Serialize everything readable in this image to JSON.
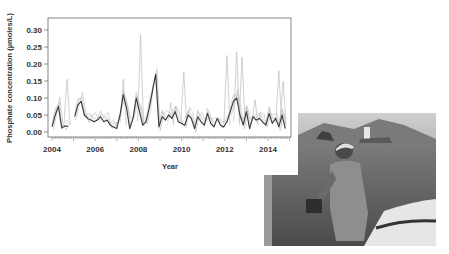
{
  "chart_data": {
    "type": "line",
    "title": "",
    "xlabel": "Year",
    "ylabel": "Phosphate concentration (µmoles/L)",
    "xlim": [
      2003.8,
      2015.0
    ],
    "ylim": [
      -0.01,
      0.33
    ],
    "x_ticks": [
      "2004",
      "2006",
      "2008",
      "2010",
      "2012",
      "2014"
    ],
    "y_ticks": [
      "0.00",
      "0.05",
      "0.10",
      "0.15",
      "0.20",
      "0.25",
      "0.30"
    ],
    "grid": false,
    "legend": null,
    "series": [
      {
        "name": "mean (dark line)",
        "color": "#3a3a3a",
        "segments": [
          {
            "x": [
              2004.0,
              2004.15,
              2004.3,
              2004.45,
              2004.6,
              2004.75
            ],
            "y": [
              0.015,
              0.05,
              0.075,
              0.012,
              0.018,
              0.016
            ]
          },
          {
            "x": [
              2005.05,
              2005.2,
              2005.35,
              2005.5,
              2005.65,
              2005.8,
              2005.95,
              2006.1,
              2006.25,
              2006.4,
              2006.55,
              2006.7,
              2006.85,
              2007.0,
              2007.15,
              2007.3,
              2007.45,
              2007.6,
              2007.75,
              2007.9,
              2008.05,
              2008.2,
              2008.35,
              2008.5,
              2008.65,
              2008.8,
              2008.95,
              2009.1,
              2009.25,
              2009.4,
              2009.55,
              2009.7,
              2009.85,
              2010.0,
              2010.15,
              2010.3,
              2010.45,
              2010.6,
              2010.75,
              2010.9,
              2011.05,
              2011.2,
              2011.35,
              2011.5,
              2011.65,
              2011.8,
              2011.95,
              2012.1,
              2012.25,
              2012.4,
              2012.55,
              2012.7,
              2012.85,
              2013.0,
              2013.15,
              2013.3,
              2013.45,
              2013.6,
              2013.75,
              2013.9,
              2014.05,
              2014.2,
              2014.35,
              2014.5,
              2014.65,
              2014.8
            ],
            "y": [
              0.045,
              0.08,
              0.09,
              0.05,
              0.04,
              0.035,
              0.03,
              0.035,
              0.045,
              0.03,
              0.035,
              0.02,
              0.015,
              0.01,
              0.05,
              0.11,
              0.07,
              0.01,
              0.04,
              0.1,
              0.06,
              0.02,
              0.03,
              0.07,
              0.12,
              0.17,
              0.015,
              0.045,
              0.035,
              0.05,
              0.04,
              0.06,
              0.03,
              0.025,
              0.02,
              0.05,
              0.04,
              0.01,
              0.045,
              0.03,
              0.02,
              0.055,
              0.025,
              0.015,
              0.04,
              0.02,
              0.015,
              0.03,
              0.06,
              0.09,
              0.1,
              0.05,
              0.02,
              0.06,
              0.01,
              0.045,
              0.035,
              0.04,
              0.03,
              0.02,
              0.055,
              0.025,
              0.04,
              0.015,
              0.05,
              0.01
            ]
          }
        ]
      },
      {
        "name": "stations (light lines)",
        "color": "#bdbdbd",
        "peaks": [
          {
            "x": 2004.7,
            "y": 0.155
          },
          {
            "x": 2007.3,
            "y": 0.155
          },
          {
            "x": 2008.1,
            "y": 0.285
          },
          {
            "x": 2009.5,
            "y": 0.085
          },
          {
            "x": 2010.1,
            "y": 0.175
          },
          {
            "x": 2012.1,
            "y": 0.225
          },
          {
            "x": 2012.55,
            "y": 0.235
          },
          {
            "x": 2012.8,
            "y": 0.22
          },
          {
            "x": 2013.4,
            "y": 0.095
          },
          {
            "x": 2014.5,
            "y": 0.18
          },
          {
            "x": 2014.7,
            "y": 0.15
          }
        ]
      }
    ]
  },
  "photo": {
    "description": "grayscale photograph of a person on a boat lowering sampling equipment into the sea, coastline and island in background"
  }
}
